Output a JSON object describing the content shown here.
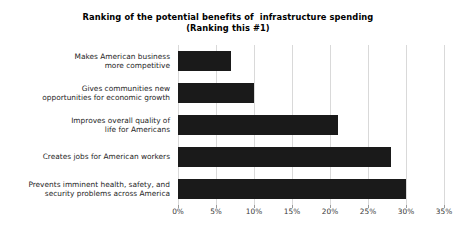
{
  "chart": {
    "title_line_1": "Ranking of the potential benefits of  infrastructure spending",
    "title_line_2": "(Ranking this #1)"
  },
  "chart_data": {
    "type": "bar",
    "orientation": "horizontal",
    "title": "Ranking of the potential benefits of  infrastructure spending (Ranking this #1)",
    "xlabel": "",
    "ylabel": "",
    "xlim": [
      0,
      35
    ],
    "grid": true,
    "legend": "none",
    "bar_color": "#1a1a1a",
    "categories": [
      "Makes American business more competitive",
      "Gives communities new opportunities for economic growth",
      "Improves overall quality of life for Americans",
      "Creates jobs for American workers",
      "Prevents imminent health, safety, and security problems across America"
    ],
    "category_lines": [
      [
        "Makes American business",
        "more competitive"
      ],
      [
        "Gives communities new",
        "opportunities for economic growth"
      ],
      [
        "Improves overall quality of",
        "life for Americans"
      ],
      [
        "Creates jobs for American workers"
      ],
      [
        "Prevents imminent health, safety, and",
        "security problems across America"
      ]
    ],
    "values": [
      7,
      10,
      21,
      28,
      30
    ],
    "value_unit": "%",
    "xticks": [
      0,
      5,
      10,
      15,
      20,
      25,
      30,
      35
    ],
    "xtick_labels": [
      "0%",
      "5%",
      "10%",
      "15%",
      "20%",
      "25%",
      "30%",
      "35%"
    ]
  }
}
